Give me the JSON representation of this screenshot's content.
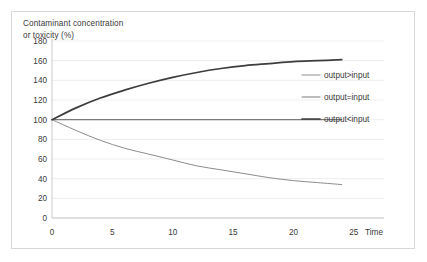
{
  "chart_data": {
    "type": "line",
    "title": "Contaminant concentration\nor  toxicity (%)",
    "xlabel": "Time",
    "ylabel": "Contaminant concentration or toxicity (%)",
    "xlim": [
      0,
      27.5
    ],
    "ylim": [
      0,
      180
    ],
    "xticks": [
      0,
      5,
      10,
      15,
      20,
      25
    ],
    "yticks": [
      0,
      20,
      40,
      60,
      80,
      100,
      120,
      140,
      160,
      180
    ],
    "xtick_labels": [
      "0",
      "5",
      "10",
      "15",
      "20",
      "25"
    ],
    "ytick_labels": [
      "0",
      "20",
      "40",
      "60",
      "80",
      "100",
      "120",
      "140",
      "160",
      "180"
    ],
    "grid": true,
    "grid_axis": "y",
    "legend_position": "right",
    "x": [
      0,
      2,
      4,
      6,
      8,
      10,
      12,
      14,
      16,
      18,
      20,
      22,
      24
    ],
    "series": [
      {
        "name": "output>input",
        "color": "#8c8c8c",
        "width": 1.0,
        "values": [
          100,
          89,
          79,
          71,
          65,
          59,
          53,
          49,
          45,
          41,
          38,
          36,
          34
        ]
      },
      {
        "name": "output=input",
        "color": "#7a7a7a",
        "width": 1.1,
        "values": [
          100,
          100,
          100,
          100,
          100,
          100,
          100,
          100,
          100,
          100,
          100,
          100,
          100
        ]
      },
      {
        "name": "output<input",
        "color": "#3d3d3d",
        "width": 1.7,
        "values": [
          100,
          112,
          122,
          130,
          137,
          143,
          148,
          152,
          155,
          157,
          159,
          160,
          161
        ]
      }
    ]
  },
  "legend": {
    "entries": [
      {
        "label": "output>input"
      },
      {
        "label": "output=input"
      },
      {
        "label": "output<input"
      }
    ]
  },
  "axis": {
    "x_name": "Time"
  }
}
